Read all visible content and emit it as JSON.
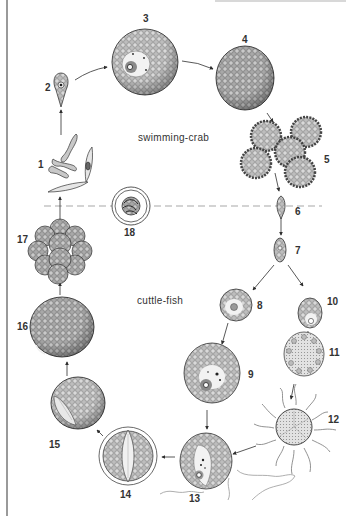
{
  "diagram": {
    "type": "life-cycle",
    "hosts": {
      "upper": "swimming-crab",
      "lower": "cuttle-fish"
    },
    "colors": {
      "outline": "#3a3a3a",
      "cell_fill": "#b9b9b9",
      "cell_texture": "#7a7a7a",
      "nucleus_fill": "#ececec",
      "dashed_divider": "#a8a8a8",
      "arrow": "#2e2e2e",
      "frame_line": "#9a9a9a"
    },
    "stages": [
      {
        "id": 1,
        "label": "1",
        "shape": "sporozoites-and-spore-valve"
      },
      {
        "id": 2,
        "label": "2",
        "shape": "teardrop-cell"
      },
      {
        "id": 3,
        "label": "3",
        "shape": "round-cell-with-nucleus"
      },
      {
        "id": 4,
        "label": "4",
        "shape": "large-round-cell"
      },
      {
        "id": 5,
        "label": "5",
        "shape": "spiny-cell-cluster"
      },
      {
        "id": 6,
        "label": "6",
        "shape": "small-elongate-cell"
      },
      {
        "id": 7,
        "label": "7",
        "shape": "oval-cell"
      },
      {
        "id": 8,
        "label": "8",
        "shape": "oval-cell-with-nucleus"
      },
      {
        "id": 9,
        "label": "9",
        "shape": "round-cell-with-nucleus"
      },
      {
        "id": 10,
        "label": "10",
        "shape": "oval-cell-with-nucleus"
      },
      {
        "id": 11,
        "label": "11",
        "shape": "oval-cell-with-ring-of-nuclei"
      },
      {
        "id": 12,
        "label": "12",
        "shape": "cell-with-flagella"
      },
      {
        "id": 13,
        "label": "13",
        "shape": "round-cell-with-gamete"
      },
      {
        "id": 14,
        "label": "14",
        "shape": "encysted-cell-with-spindle"
      },
      {
        "id": 15,
        "label": "15",
        "shape": "round-cell-with-spindle"
      },
      {
        "id": 16,
        "label": "16",
        "shape": "large-round-cell"
      },
      {
        "id": 17,
        "label": "17",
        "shape": "multicellular-cluster"
      },
      {
        "id": 18,
        "label": "18",
        "shape": "encysted-coiled-sporozoite"
      }
    ]
  }
}
